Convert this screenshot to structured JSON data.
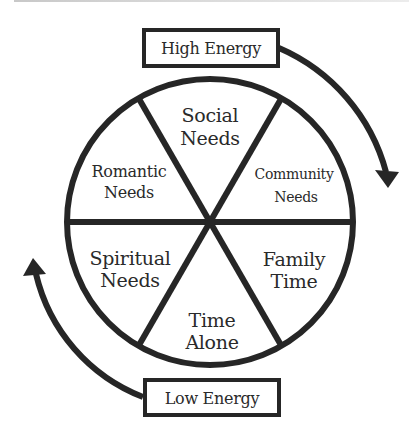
{
  "diagram": {
    "type": "cycle-wheel",
    "stroke_color": "#262626",
    "background": "#ffffff",
    "top_label": {
      "text": "High Energy",
      "position": "top"
    },
    "bottom_label": {
      "text": "Low Energy",
      "position": "bottom"
    },
    "segments": [
      {
        "id": "social",
        "line1": "Social",
        "line2": "Needs",
        "position": "top"
      },
      {
        "id": "community",
        "line1": "Community",
        "line2": "Needs",
        "position": "upper-right"
      },
      {
        "id": "family",
        "line1": "Family",
        "line2": "Time",
        "position": "lower-right"
      },
      {
        "id": "alone",
        "line1": "Time",
        "line2": "Alone",
        "position": "bottom"
      },
      {
        "id": "spiritual",
        "line1": "Spiritual",
        "line2": "Needs",
        "position": "lower-left"
      },
      {
        "id": "romantic",
        "line1": "Romantic",
        "line2": "Needs",
        "position": "upper-left"
      }
    ],
    "arrows": [
      {
        "id": "high-to-down",
        "from": "High Energy",
        "direction": "clockwise, down the right side"
      },
      {
        "id": "low-to-up",
        "from": "Low Energy",
        "direction": "clockwise, up the left side"
      }
    ]
  }
}
